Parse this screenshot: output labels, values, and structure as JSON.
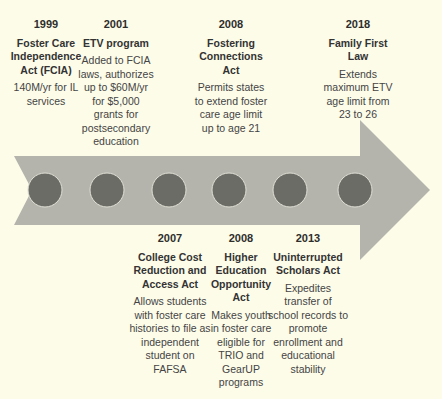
{
  "timeline": {
    "colors": {
      "background": "#fdfce9",
      "arrow": "#b4b4ad",
      "circle": "#6c6c66",
      "circle_border": "#e0e0d6"
    },
    "top_events": [
      {
        "year": "1999",
        "title": "Foster Care Independence Act (FCIA)",
        "description": "140M/yr for IL services"
      },
      {
        "year": "2001",
        "title": "ETV program",
        "description": "Added to FCIA laws, authorizes up to $60M/yr for $5,000 grants for postsecondary education"
      },
      {
        "year": "2008",
        "title": "Fostering Connections Act",
        "description": "Permits states to extend foster care age limit up to age 21"
      },
      {
        "year": "2018",
        "title": "Family First Law",
        "description": "Extends maximum ETV age limit from 23 to 26"
      }
    ],
    "bottom_events": [
      {
        "year": "2007",
        "title": "College Cost Reduction and Access Act",
        "description": "Allows students with foster care histories to file as independent student on FAFSA"
      },
      {
        "year": "2008",
        "title": "Higher Education Opportunity Act",
        "description": "Makes youth in foster care eligible for TRIO and GearUP programs"
      },
      {
        "year": "2013",
        "title": "Uninterrupted Scholars Act",
        "description": "Expedites transfer of school records to promote enrollment and educational stability"
      }
    ],
    "milestone_count": 6
  }
}
